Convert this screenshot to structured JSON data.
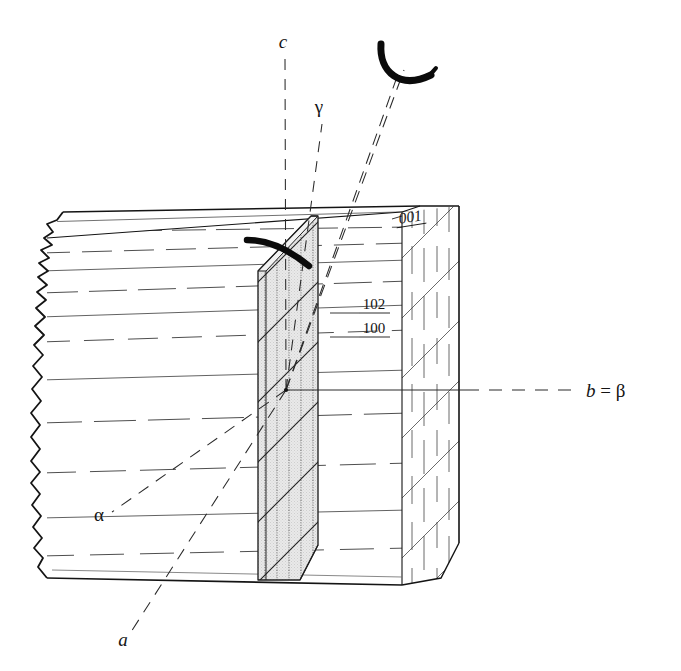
{
  "figure": {
    "background_color": "#ffffff",
    "ink_color": "#141414",
    "slab_fill_color": "#e9e9e9",
    "hatch_color": "#3a3a3a"
  },
  "header": {
    "ghost_text": " "
  },
  "axes": [
    {
      "id": "c",
      "label": "c",
      "style": "italic-serif",
      "label_x": 283,
      "label_y": 48,
      "line": "vertical dashed from origin upward",
      "dashed": true
    },
    {
      "id": "gamma",
      "label": "γ",
      "style": "greek",
      "label_x": 319,
      "label_y": 113,
      "line": "dashed from origin up-right",
      "dashed": true
    },
    {
      "id": "b",
      "label": "b = β",
      "label_x": 590,
      "label_y": 397,
      "line": "horizontal solid through block then dashed to label",
      "dashed": true
    },
    {
      "id": "alpha",
      "label": "α",
      "style": "greek",
      "label_x": 99,
      "label_y": 521,
      "line": "dashed from origin down-left",
      "dashed": true
    },
    {
      "id": "a",
      "label": "a",
      "style": "italic-serif",
      "label_x": 123,
      "label_y": 646,
      "line": "dashed from origin down-left steeply",
      "dashed": true
    }
  ],
  "miller_indices": [
    {
      "id": "001",
      "label": "001",
      "x": 411,
      "y": 222,
      "face": "top",
      "underlined": true,
      "italic": true
    },
    {
      "id": "102",
      "label": "102",
      "x": 374,
      "y": 309,
      "face": "front",
      "underlined": true,
      "italic": false
    },
    {
      "id": "100",
      "label": "100",
      "x": 374,
      "y": 333,
      "face": "front",
      "underlined": true,
      "italic": false
    }
  ],
  "arcs": [
    {
      "id": "upper-arc",
      "description": "thick black arc above block near c and gamma axes"
    },
    {
      "id": "inner-arc",
      "description": "thick black arc on top of shaded slab"
    }
  ],
  "block": {
    "description": "rectangular crystal block, broken jagged left edge, cleavage lines on front face, hatched right end face",
    "left_edge": "jagged broken fracture",
    "front_face_lines": "alternating solid and dashed horizontal cleavage traces",
    "right_face_hatch": "diagonal and vertical ruling"
  },
  "slab": {
    "description": "vertical shaded lamella slice through the block",
    "fill": "#e9e9e9",
    "hatch": "vertical dotted ruling plus diagonal lines"
  }
}
